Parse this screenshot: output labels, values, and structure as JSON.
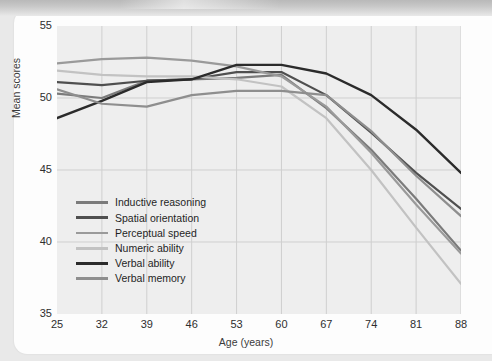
{
  "page": {
    "bleed_through_text": "ual Development"
  },
  "chart_data": {
    "type": "line",
    "title": "",
    "xlabel": "Age (years)",
    "ylabel": "Mean scores",
    "x": [
      25,
      32,
      39,
      46,
      53,
      60,
      67,
      74,
      81,
      88
    ],
    "xlim": [
      25,
      88
    ],
    "ylim": [
      35,
      55
    ],
    "xticks": [
      "25",
      "32",
      "39",
      "46",
      "53",
      "60",
      "67",
      "74",
      "81",
      "88"
    ],
    "yticks": [
      "35",
      "40",
      "45",
      "50",
      "55"
    ],
    "grid": true,
    "legend_position": "lower-left-inside",
    "series": [
      {
        "name": "Inductive reasoning",
        "color": "#7b7b7b",
        "width": 2.2,
        "values": [
          50.3,
          50.0,
          51.2,
          51.3,
          51.4,
          51.6,
          49.3,
          46.4,
          43.0,
          39.4
        ]
      },
      {
        "name": "Spatial orientation",
        "color": "#4f4f4f",
        "width": 2.2,
        "values": [
          51.1,
          50.9,
          51.2,
          51.3,
          51.8,
          51.8,
          50.2,
          47.6,
          44.8,
          42.3
        ]
      },
      {
        "name": "Perceptual speed",
        "color": "#9a9a9a",
        "width": 2.2,
        "values": [
          52.4,
          52.7,
          52.8,
          52.6,
          52.2,
          51.5,
          49.4,
          46.2,
          42.6,
          39.2
        ]
      },
      {
        "name": "Numeric ability",
        "color": "#c2c2c2",
        "width": 2.2,
        "values": [
          51.9,
          51.6,
          51.5,
          51.5,
          51.3,
          50.8,
          48.6,
          45.0,
          41.0,
          37.1
        ]
      },
      {
        "name": "Verbal ability",
        "color": "#2b2b2b",
        "width": 2.4,
        "values": [
          48.6,
          49.8,
          51.1,
          51.3,
          52.3,
          52.3,
          51.7,
          50.2,
          47.8,
          44.8
        ]
      },
      {
        "name": "Verbal memory",
        "color": "#8e8e8e",
        "width": 2.2,
        "values": [
          50.6,
          49.6,
          49.4,
          50.2,
          50.5,
          50.5,
          50.2,
          47.7,
          44.6,
          41.8
        ]
      }
    ]
  }
}
